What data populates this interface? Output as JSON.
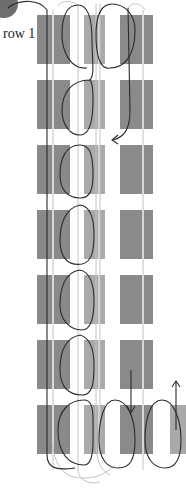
{
  "diagram": {
    "row_label": "row 1",
    "row_count": 7,
    "columns": [
      "left-block",
      "middle-block",
      "right-block"
    ],
    "extra_bottom_block": true,
    "colors": {
      "dark_block": "#8a8a8a",
      "mid_block": "#a9a9a9",
      "stripe": "#d6d6d6",
      "thread_dark": "#2b2b2b",
      "thread_light": "#c4c4c4",
      "circle": "#6e6e6e"
    },
    "arrows": [
      {
        "name": "arrow-left",
        "direction": "left"
      },
      {
        "name": "arrow-down",
        "direction": "down"
      },
      {
        "name": "arrow-up",
        "direction": "up"
      }
    ]
  }
}
